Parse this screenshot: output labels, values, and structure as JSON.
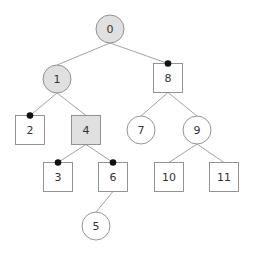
{
  "colors": {
    "background": "#ffffff",
    "stroke": "#888888",
    "edge": "#999999",
    "fill_default": "#ffffff",
    "fill_highlight": "#e0e0e0",
    "marker": "#111111",
    "text": "#333333"
  },
  "nodes": [
    {
      "id": "0",
      "label": "0",
      "shape": "circle",
      "x": 110,
      "y": 29,
      "highlight": true,
      "marker": false
    },
    {
      "id": "1",
      "label": "1",
      "shape": "circle",
      "x": 57,
      "y": 79,
      "highlight": true,
      "marker": false
    },
    {
      "id": "8",
      "label": "8",
      "shape": "square",
      "x": 168,
      "y": 78,
      "highlight": false,
      "marker": true
    },
    {
      "id": "2",
      "label": "2",
      "shape": "square",
      "x": 30,
      "y": 130,
      "highlight": false,
      "marker": true
    },
    {
      "id": "4",
      "label": "4",
      "shape": "square",
      "x": 86,
      "y": 130,
      "highlight": true,
      "marker": false
    },
    {
      "id": "7",
      "label": "7",
      "shape": "circle",
      "x": 141,
      "y": 130,
      "highlight": false,
      "marker": false
    },
    {
      "id": "9",
      "label": "9",
      "shape": "circle",
      "x": 197,
      "y": 130,
      "highlight": false,
      "marker": false
    },
    {
      "id": "3",
      "label": "3",
      "shape": "square",
      "x": 58,
      "y": 177,
      "highlight": false,
      "marker": true
    },
    {
      "id": "6",
      "label": "6",
      "shape": "square",
      "x": 113,
      "y": 177,
      "highlight": false,
      "marker": true
    },
    {
      "id": "10",
      "label": "10",
      "shape": "square",
      "x": 169,
      "y": 177,
      "highlight": false,
      "marker": false
    },
    {
      "id": "11",
      "label": "11",
      "shape": "square",
      "x": 224,
      "y": 177,
      "highlight": false,
      "marker": false
    },
    {
      "id": "5",
      "label": "5",
      "shape": "circle",
      "x": 96,
      "y": 226,
      "highlight": false,
      "marker": false
    }
  ],
  "edges": [
    [
      "0",
      "1"
    ],
    [
      "0",
      "8"
    ],
    [
      "1",
      "2"
    ],
    [
      "1",
      "4"
    ],
    [
      "8",
      "7"
    ],
    [
      "8",
      "9"
    ],
    [
      "4",
      "3"
    ],
    [
      "4",
      "6"
    ],
    [
      "9",
      "10"
    ],
    [
      "9",
      "11"
    ],
    [
      "6",
      "5"
    ]
  ]
}
